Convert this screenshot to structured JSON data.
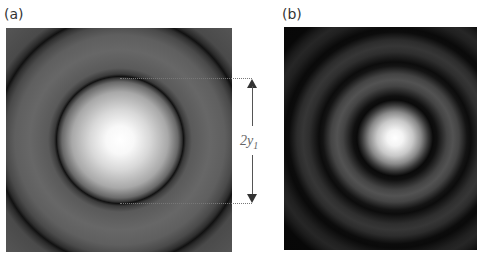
{
  "figure": {
    "panels": [
      {
        "label": "(a)",
        "description": "Airy pattern, saturated display showing central disk and first dark ring",
        "colormap": "grayscale"
      },
      {
        "label": "(b)",
        "description": "Airy pattern with multiple concentric rings",
        "colormap": "grayscale"
      }
    ],
    "annotation": {
      "dimension_label": "2y",
      "dimension_subscript": "1",
      "meaning": "diameter of first dark ring"
    }
  }
}
